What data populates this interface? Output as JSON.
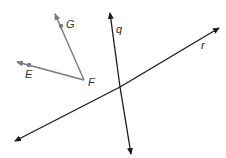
{
  "diagram": {
    "rays": {
      "FG": {
        "from": "F",
        "to": "G",
        "color": "#7a7a7a"
      },
      "FE": {
        "from": "F",
        "to": "E",
        "color": "#7a7a7a"
      }
    },
    "lines": {
      "q": {
        "label": "q",
        "color": "#1a1a1a"
      },
      "r": {
        "label": "r",
        "color": "#1a1a1a"
      }
    },
    "points": {
      "G": {
        "label": "G"
      },
      "E": {
        "label": "E"
      },
      "F": {
        "label": "F"
      }
    }
  }
}
